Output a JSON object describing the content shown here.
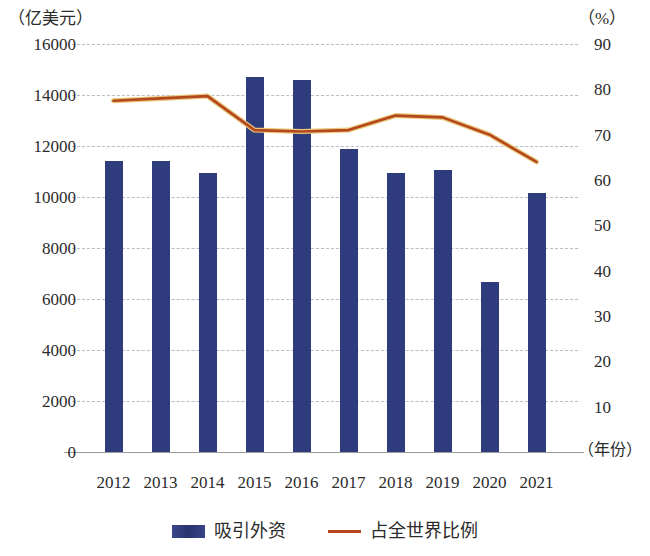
{
  "chart_data": {
    "type": "bar",
    "title": "",
    "subtitle": "",
    "xlabel": "（年份）",
    "ylabel": "（亿美元）",
    "y2label": "（%）",
    "categories": [
      "2012",
      "2013",
      "2014",
      "2015",
      "2016",
      "2017",
      "2018",
      "2019",
      "2020",
      "2021"
    ],
    "ylim": [
      0,
      16000
    ],
    "y2lim": [
      0,
      90
    ],
    "yticks": [
      "0",
      "2000",
      "4000",
      "6000",
      "8000",
      "10000",
      "12000",
      "14000",
      "16000"
    ],
    "ytick_values": [
      0,
      2000,
      4000,
      6000,
      8000,
      10000,
      12000,
      14000,
      16000
    ],
    "y2ticks": [
      "10",
      "20",
      "30",
      "40",
      "50",
      "60",
      "70",
      "80",
      "90"
    ],
    "y2tick_values": [
      10,
      20,
      30,
      40,
      50,
      60,
      70,
      80,
      90
    ],
    "grid": true,
    "legend_position": "bottom",
    "series": [
      {
        "name": "吸引外资",
        "chart": "bar",
        "axis": "left",
        "unit": "亿美元",
        "color": "#2e3b7d",
        "values": [
          11400,
          11400,
          10950,
          14700,
          14600,
          11880,
          10930,
          11060,
          6650,
          10170
        ]
      },
      {
        "name": "占全世界比例",
        "chart": "line",
        "axis": "right",
        "unit": "%",
        "color": "#b5471f",
        "values": [
          77.5,
          78.0,
          78.5,
          71.0,
          70.7,
          71.0,
          74.2,
          73.8,
          70.0,
          64.0
        ]
      }
    ]
  },
  "axes": {
    "left_unit": "（亿美元）",
    "right_unit": "（%）",
    "x_unit": "（年份）"
  },
  "legend": {
    "items": [
      {
        "label": "吸引外资",
        "swatch": "bar-swatch",
        "color": "#2e3b7d"
      },
      {
        "label": "占全世界比例",
        "swatch": "line-swatch",
        "color": "#b5471f"
      }
    ]
  }
}
